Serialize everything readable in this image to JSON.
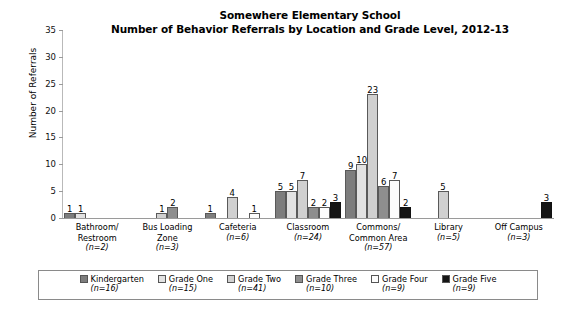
{
  "chart_data": {
    "type": "bar",
    "title": "Somewhere Elementary School",
    "subtitle": "Number of Behavior Referrals by Location and Grade Level, 2012-13",
    "xlabel": "",
    "ylabel": "Number of Referrals",
    "ylim": [
      0,
      35
    ],
    "yticks": [
      0,
      5,
      10,
      15,
      20,
      25,
      30,
      35
    ],
    "grid": false,
    "legend_position": "bottom",
    "categories": [
      "Bathroom/ Restroom",
      "Bus Loading Zone",
      "Cafeteria",
      "Classroom",
      "Commons/ Common Area",
      "Library",
      "Off Campus"
    ],
    "category_counts": [
      "(n=2)",
      "(n=3)",
      "(n=6)",
      "(n=24)",
      "(n=57)",
      "(n=5)",
      "(n=3)"
    ],
    "series": [
      {
        "name": "Kindergarten",
        "count": "(n=16)",
        "color": "#7d7d7d",
        "values": [
          1,
          0,
          1,
          5,
          9,
          0,
          0
        ]
      },
      {
        "name": "Grade One",
        "count": "(n=15)",
        "color": "#e2e2e2",
        "values": [
          1,
          0,
          0,
          5,
          10,
          0,
          0
        ]
      },
      {
        "name": "Grade Two",
        "count": "(n=41)",
        "color": "#d0d0d0",
        "values": [
          0,
          1,
          4,
          7,
          23,
          5,
          0
        ]
      },
      {
        "name": "Grade Three",
        "count": "(n=10)",
        "color": "#8e8e8e",
        "values": [
          0,
          2,
          0,
          2,
          6,
          0,
          0
        ]
      },
      {
        "name": "Grade Four",
        "count": "(n=9)",
        "color": "#fcfcfc",
        "values": [
          0,
          0,
          1,
          2,
          7,
          0,
          0
        ]
      },
      {
        "name": "Grade Five",
        "count": "(n=9)",
        "color": "#151515",
        "values": [
          0,
          0,
          0,
          3,
          2,
          0,
          3
        ]
      }
    ]
  },
  "axis": {
    "y_title": "Number of Referrals",
    "y_tick_labels": [
      "35",
      "30",
      "25",
      "20",
      "15",
      "10",
      "5",
      "0"
    ]
  },
  "categories_display": [
    {
      "line1": "Bathroom/",
      "line2": "Restroom",
      "n": "(n=2)"
    },
    {
      "line1": "Bus Loading",
      "line2": "Zone",
      "n": "(n=3)"
    },
    {
      "line1": "Cafeteria",
      "line2": "",
      "n": "(n=6)"
    },
    {
      "line1": "Classroom",
      "line2": "",
      "n": "(n=24)"
    },
    {
      "line1": "Commons/",
      "line2": "Common Area",
      "n": "(n=57)"
    },
    {
      "line1": "Library",
      "line2": "",
      "n": "(n=5)"
    },
    {
      "line1": "Off Campus",
      "line2": "",
      "n": "(n=3)"
    }
  ],
  "legend": {
    "items": [
      {
        "label": "Kindergarten",
        "count": "(n=16)"
      },
      {
        "label": "Grade One",
        "count": "(n=15)"
      },
      {
        "label": "Grade Two",
        "count": "(n=41)"
      },
      {
        "label": "Grade Three",
        "count": "(n=10)"
      },
      {
        "label": "Grade Four",
        "count": "(n=9)"
      },
      {
        "label": "Grade Five",
        "count": "(n=9)"
      }
    ]
  }
}
